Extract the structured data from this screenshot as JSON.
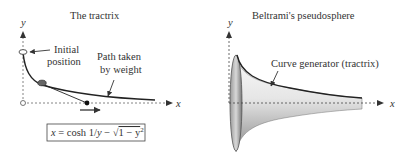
{
  "left_panel": {
    "title": "The tractrix",
    "y_axis_label": "y",
    "x_axis_label": "x",
    "annotation_initial": [
      "Initial",
      "position"
    ],
    "annotation_path": [
      "Path taken",
      "by weight"
    ],
    "equation": "x = cosh 1/y − √1 − y²",
    "equation_parts": {
      "lhs": "x",
      "eq": " = cosh 1/",
      "y": "y",
      "minus": " − ",
      "sqrt": "√",
      "radicand": "1 − y",
      "exp": "2"
    }
  },
  "right_panel": {
    "title": "Beltrami's pseudosphere",
    "y_axis_label": "y",
    "x_axis_label": "x",
    "annotation_curve": "Curve generator (tractrix)"
  },
  "colors": {
    "ink": "#333333",
    "axis": "#555555",
    "surface_dark": "#8a8a8a",
    "surface_light": "#f0f0f0"
  }
}
